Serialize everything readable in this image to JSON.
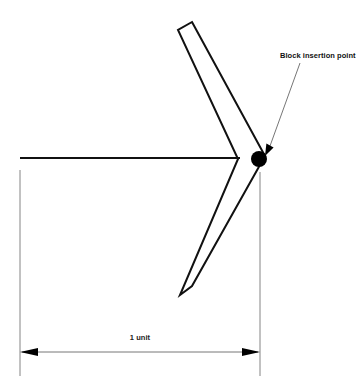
{
  "figure": {
    "background_color": "#ffffff",
    "line_color": "#111111",
    "thin_line_color": "#555555",
    "marker_color": "#000000"
  },
  "annotations": {
    "insertion_point_label": "Block insertion point",
    "dimension_label": "1 unit"
  },
  "shapes": {
    "chevron": {
      "name": "V-shaped block outline",
      "outer_points": "192,22 265,156 192,286 180,295 238,159 178,30",
      "upper_arm_top_corners": [
        [
          178,
          30
        ],
        [
          192,
          22
        ]
      ],
      "lower_arm_bottom_corners": [
        [
          180,
          295
        ],
        [
          194,
          286
        ]
      ],
      "vertex_outer": [
        265,
        156
      ],
      "vertex_inner": [
        238,
        159
      ]
    },
    "centerline": {
      "name": "horizontal centerline",
      "x1": 20,
      "y1": 158,
      "x2": 240,
      "y2": 158
    },
    "insertion_dot": {
      "cx": 259,
      "cy": 159,
      "r": 8
    }
  },
  "leader": {
    "name": "callout leader line",
    "x1": 300,
    "y1": 63,
    "x2": 268,
    "y2": 149,
    "arrow_tip": [
      265,
      155
    ]
  },
  "dimension": {
    "name": "1 unit dimension",
    "left_extension": {
      "x": 20,
      "y1": 170,
      "y2": 376
    },
    "right_extension": {
      "x": 260,
      "y1": 172,
      "y2": 376
    },
    "dim_line": {
      "y": 352,
      "x1": 20,
      "x2": 260
    },
    "label_position": {
      "x": 140,
      "y": 340
    }
  },
  "text_positions": {
    "insertion_label": {
      "x": 280,
      "y": 58
    },
    "dimension_label": {
      "x": 140,
      "y": 340
    }
  }
}
